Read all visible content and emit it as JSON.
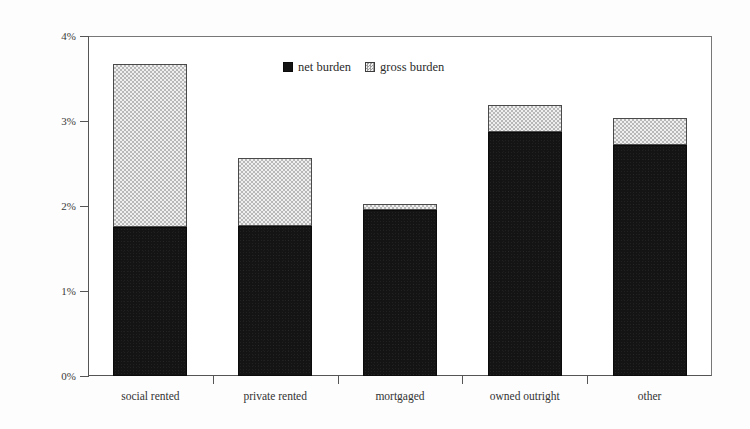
{
  "chart_data": {
    "type": "bar",
    "stacked": true,
    "title": "",
    "xlabel": "",
    "ylabel": "percentage of gross income",
    "categories": [
      "social rented",
      "private rented",
      "mortgaged",
      "owned outright",
      "other"
    ],
    "series": [
      {
        "name": "net burden",
        "color": "#141414",
        "values": [
          1.75,
          1.77,
          1.95,
          2.87,
          2.72
        ]
      },
      {
        "name": "gross burden",
        "color": "#e3e3e3",
        "values": [
          3.67,
          2.57,
          2.02,
          3.19,
          3.03
        ]
      }
    ],
    "ylim": [
      0,
      4
    ],
    "y_ticks": [
      0,
      1,
      2,
      3,
      4
    ],
    "y_tick_labels": [
      "0%",
      "1%",
      "2%",
      "3%",
      "4%"
    ],
    "grid": false,
    "legend_position": "top-center",
    "legend": [
      "net burden",
      "gross burden"
    ],
    "note": "Series values are cumulative stack tops: net burden is the solid black base, gross burden is the dotted total height."
  },
  "axis": {
    "y_title": "percentage of gross income",
    "ticks": [
      {
        "label": "4%",
        "value": 4
      },
      {
        "label": "3%",
        "value": 3
      },
      {
        "label": "2%",
        "value": 2
      },
      {
        "label": "1%",
        "value": 1
      },
      {
        "label": "0%",
        "value": 0
      }
    ]
  },
  "categories": [
    {
      "label": "social rented",
      "net": 1.75,
      "gross": 3.67
    },
    {
      "label": "private rented",
      "net": 1.77,
      "gross": 2.57
    },
    {
      "label": "mortgaged",
      "net": 1.95,
      "gross": 2.02
    },
    {
      "label": "owned outright",
      "net": 2.87,
      "gross": 3.19
    },
    {
      "label": "other",
      "net": 2.72,
      "gross": 3.03
    }
  ],
  "legend": {
    "items": [
      {
        "label": "net burden",
        "swatch": "solid-black-square"
      },
      {
        "label": "gross burden",
        "swatch": "dotted-grey-square"
      }
    ]
  },
  "colors": {
    "net": "#141414",
    "gross": "#e3e3e3",
    "axis": "#555555",
    "text": "#2b2b2b",
    "background": "#ffffff"
  }
}
